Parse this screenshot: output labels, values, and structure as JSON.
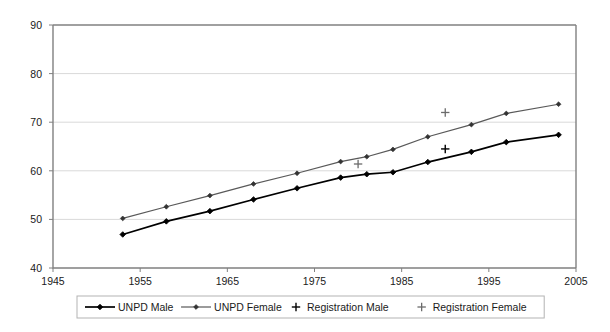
{
  "chart_data": {
    "type": "line",
    "title": "",
    "xlabel": "",
    "ylabel": "",
    "xlim": [
      1945,
      2005
    ],
    "ylim": [
      40,
      90
    ],
    "xticks": [
      "1945",
      "1955",
      "1965",
      "1975",
      "1985",
      "1995",
      "2005"
    ],
    "yticks": [
      "40",
      "50",
      "60",
      "70",
      "80",
      "90"
    ],
    "grid": "horizontal",
    "legend_position": "bottom",
    "series": [
      {
        "name": "UNPD Male",
        "marker": "diamond",
        "color": "#000000",
        "x": [
          1953,
          1958,
          1963,
          1968,
          1973,
          1978,
          1981,
          1984,
          1988,
          1993,
          1997,
          2003
        ],
        "values": [
          46.9,
          49.6,
          51.7,
          54.1,
          56.4,
          58.6,
          59.3,
          59.7,
          61.8,
          63.9,
          65.9,
          67.4
        ]
      },
      {
        "name": "UNPD Female",
        "marker": "diamond",
        "color": "#595959",
        "x": [
          1953,
          1958,
          1963,
          1968,
          1973,
          1978,
          1981,
          1984,
          1988,
          1993,
          1997,
          2003
        ],
        "values": [
          50.2,
          52.6,
          54.9,
          57.3,
          59.5,
          61.9,
          62.9,
          64.4,
          67.0,
          69.5,
          71.8,
          73.7
        ]
      },
      {
        "name": "Registration Male",
        "marker": "plus",
        "color": "#000000",
        "x": [
          1990
        ],
        "values": [
          64.5
        ]
      },
      {
        "name": "Registration Female",
        "marker": "plus",
        "color": "#6b6b6b",
        "x": [
          1980,
          1990
        ],
        "values": [
          61.4,
          72.0
        ]
      }
    ],
    "legend": [
      {
        "label": "UNPD Male",
        "marker": "line-diamond",
        "color": "#000000"
      },
      {
        "label": "UNPD Female",
        "marker": "line-diamond",
        "color": "#595959"
      },
      {
        "label": "Registration Male",
        "marker": "plus",
        "color": "#000000"
      },
      {
        "label": "Registration Female",
        "marker": "plus",
        "color": "#6b6b6b"
      }
    ]
  }
}
